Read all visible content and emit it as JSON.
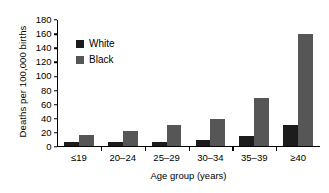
{
  "chart_data": {
    "type": "bar",
    "title": "",
    "xlabel": "Age group (years)",
    "ylabel": "Deaths per 100,000 births",
    "categories": [
      "≤19",
      "20–24",
      "25–29",
      "30–34",
      "35–39",
      "≥40"
    ],
    "series": [
      {
        "name": "White",
        "color": "#1c1c1c",
        "values": [
          5,
          5,
          6,
          8,
          14,
          29
        ]
      },
      {
        "name": "Black",
        "color": "#565656",
        "values": [
          15,
          21,
          29,
          38,
          69,
          160
        ]
      }
    ],
    "ylim": [
      0,
      180
    ],
    "yticks": [
      0,
      20,
      40,
      60,
      80,
      100,
      120,
      140,
      160,
      180
    ],
    "ytick_labels": [
      "0",
      "20",
      "40",
      "60",
      "80",
      "100",
      "120",
      "140",
      "160",
      "180"
    ],
    "grid": false,
    "legend_position": "upper-left-inside"
  },
  "legend": {
    "entries": [
      {
        "label": "White",
        "swatch_color": "#1c1c1c"
      },
      {
        "label": "Black",
        "swatch_color": "#565656"
      }
    ]
  },
  "axes": {
    "y_title": "Deaths per 100,000 births",
    "x_title": "Age group (years)"
  }
}
